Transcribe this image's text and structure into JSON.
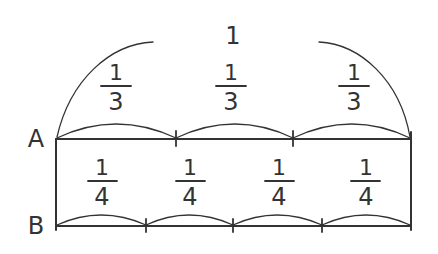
{
  "whole_label": "1",
  "bar_a": {
    "label": "A",
    "parts": 3,
    "fractions": [
      {
        "num": "1",
        "den": "3"
      },
      {
        "num": "1",
        "den": "3"
      },
      {
        "num": "1",
        "den": "3"
      }
    ]
  },
  "bar_b": {
    "label": "B",
    "parts": 4,
    "fractions": [
      {
        "num": "1",
        "den": "4"
      },
      {
        "num": "1",
        "den": "4"
      },
      {
        "num": "1",
        "den": "4"
      },
      {
        "num": "1",
        "den": "4"
      }
    ]
  },
  "colors": {
    "stroke": "#333333",
    "background": "#ffffff"
  }
}
